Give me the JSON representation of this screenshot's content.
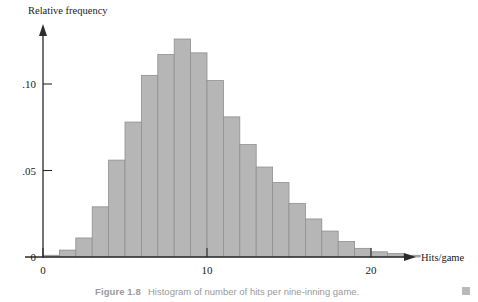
{
  "figure": {
    "caption_label": "Figure 1.8",
    "caption_text": "Histogram of number of hits per nine-inning game."
  },
  "axes": {
    "y_title": "Relative frequency",
    "x_title": "Hits/game",
    "y_ticks": [
      {
        "value": 0.05,
        "label": ".05"
      },
      {
        "value": 0.1,
        "label": ".10"
      }
    ],
    "x_ticks": [
      {
        "value": 0,
        "label": "0"
      },
      {
        "value": 10,
        "label": "10"
      },
      {
        "value": 20,
        "label": "20"
      }
    ],
    "zero_label": "0"
  },
  "style": {
    "bar_fill": "#b6b6b6",
    "bar_stroke": "#8f8f8f",
    "axis_color": "#2b2b2b",
    "caption_color": "#9a9a9a"
  },
  "chart_data": {
    "type": "bar",
    "title": "Histogram of number of hits per nine-inning game.",
    "xlabel": "Hits/game",
    "ylabel": "Relative frequency",
    "xlim": [
      0,
      23
    ],
    "ylim": [
      0,
      0.135
    ],
    "grid": false,
    "legend": null,
    "bin_width": 1,
    "categories": [
      0,
      1,
      2,
      3,
      4,
      5,
      6,
      7,
      8,
      9,
      10,
      11,
      12,
      13,
      14,
      15,
      16,
      17,
      18,
      19,
      20,
      21,
      22
    ],
    "values": [
      0.001,
      0.004,
      0.011,
      0.029,
      0.056,
      0.078,
      0.105,
      0.117,
      0.126,
      0.118,
      0.102,
      0.081,
      0.065,
      0.052,
      0.043,
      0.031,
      0.022,
      0.015,
      0.009,
      0.005,
      0.003,
      0.002,
      0.001
    ]
  }
}
